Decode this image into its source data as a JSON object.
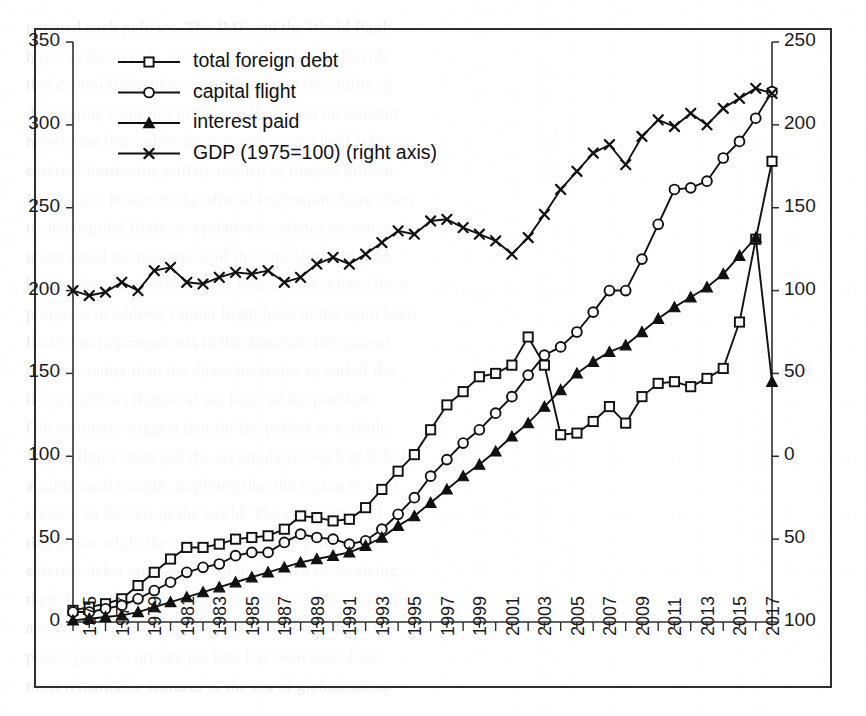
{
  "figure": {
    "background_text_lines": [
      "pursued such policies. The IMF and the World Bank",
      "have, to their credit, recently acknowledged the role",
      "that capital flight plays in undermining the ability of",
      "developing countries to finance their own investment",
      "needs, and that unless these resources are held at home,",
      "external borrowing will be needed to finance growth.",
      "In practice, however, the official institutions have often",
      "treated capital flight as a relatively minor concern, and",
      "understated the magnitude of the capital that may be",
      "hidden abroad. Moreover, the measures that have been",
      "proposed to address capital flight have in the main been",
      "limited to improvements in the domestic investment",
      "climate, rather than the direct measures to curtail the",
      "illicit outflows that lie at the heart of the problem.",
      "Our estimates suggest that for the period as a whole,",
      "capital flight exceeded the accumulated stock of debt by",
      "a substantial margin, implying that the region is a net",
      "creditor to the rest of the world. The counterpart of",
      "this is that while the external assets are private, the",
      "external debts are public, and the burden of servicing",
      "them falls on the population at large through taxation",
      "and cuts in public expenditure. The transfer from the",
      "public purse to private pockets has been one of the",
      "most remarkable features of the era of globalisation."
    ],
    "axis_color": "#2f2f2f",
    "series_color": "#111111"
  },
  "chart_data": {
    "type": "line",
    "title": "",
    "xlabel": "",
    "ylabel": "",
    "y2label": "",
    "grid": false,
    "legend_position": "top-left",
    "ylim": [
      0,
      350
    ],
    "yticks": [
      0,
      50,
      100,
      150,
      200,
      250,
      300,
      350
    ],
    "ytick_labels": [
      "0",
      "50",
      "100",
      "150",
      "200",
      "250",
      "300",
      "350"
    ],
    "y2lim": [
      -100,
      250
    ],
    "y2ticks": [
      -100,
      -50,
      0,
      50,
      100,
      150,
      200,
      250
    ],
    "y2tick_labels": [
      "100",
      "50",
      "0",
      "50",
      "100",
      "150",
      "200",
      "250"
    ],
    "xlim": [
      1975,
      2018
    ],
    "xticks": [
      1975,
      1977,
      1979,
      1981,
      1983,
      1985,
      1987,
      1989,
      1991,
      1993,
      1995,
      1997,
      1999,
      2001,
      2003,
      2005,
      2007,
      2009,
      2011,
      2013,
      2015,
      2017
    ],
    "xtick_labels": [
      "1975",
      "1977",
      "1979",
      "1981",
      "1983",
      "1985",
      "1987",
      "1989",
      "1991",
      "1993",
      "1995",
      "1997",
      "1999",
      "2001",
      "2003",
      "2005",
      "2007",
      "2009",
      "2011",
      "2013",
      "2015",
      "2017"
    ],
    "x": [
      1975,
      1976,
      1977,
      1978,
      1979,
      1980,
      1981,
      1982,
      1983,
      1984,
      1985,
      1986,
      1987,
      1988,
      1989,
      1990,
      1991,
      1992,
      1993,
      1994,
      1995,
      1996,
      1997,
      1998,
      1999,
      2000,
      2001,
      2002,
      2003,
      2004,
      2005,
      2006,
      2007,
      2008,
      2009,
      2010,
      2011,
      2012,
      2013,
      2014,
      2015,
      2016,
      2017,
      2018
    ],
    "series": [
      {
        "name": "total foreign debt",
        "marker": "open-square",
        "axis": "left",
        "values": [
          7,
          9,
          11,
          14,
          22,
          30,
          38,
          45,
          45,
          47,
          50,
          51,
          52,
          56,
          64,
          63,
          61,
          62,
          69,
          80,
          91,
          101,
          116,
          131,
          139,
          148,
          150,
          155,
          172,
          155,
          113,
          114,
          121,
          130,
          120,
          136,
          144,
          145,
          142,
          147,
          153,
          181,
          231,
          278
        ]
      },
      {
        "name": "capital flight",
        "marker": "open-circle",
        "axis": "left",
        "values": [
          6,
          6,
          8,
          10,
          14,
          19,
          24,
          30,
          33,
          35,
          40,
          42,
          42,
          48,
          53,
          51,
          50,
          47,
          49,
          56,
          65,
          75,
          88,
          98,
          108,
          116,
          126,
          136,
          149,
          161,
          166,
          175,
          187,
          200,
          200,
          219,
          240,
          261,
          262,
          266,
          280,
          290,
          304,
          320
        ]
      },
      {
        "name": "interest paid",
        "marker": "filled-triangle",
        "axis": "left",
        "values": [
          1,
          2,
          3,
          4,
          6,
          9,
          12,
          15,
          18,
          21,
          24,
          27,
          30,
          33,
          36,
          38,
          40,
          42,
          46,
          51,
          58,
          64,
          72,
          80,
          88,
          95,
          103,
          112,
          120,
          130,
          140,
          150,
          157,
          163,
          167,
          175,
          183,
          190,
          196,
          202,
          210,
          221,
          232,
          145
        ]
      },
      {
        "name": "GDP (1975=100) (right axis)",
        "marker": "cross",
        "axis": "right",
        "values": [
          100,
          97,
          99,
          105,
          100,
          112,
          114,
          105,
          104,
          108,
          111,
          110,
          112,
          105,
          108,
          116,
          120,
          116,
          122,
          129,
          136,
          134,
          142,
          143,
          138,
          134,
          130,
          122,
          132,
          146,
          161,
          172,
          183,
          188,
          176,
          193,
          203,
          199,
          207,
          200,
          210,
          216,
          222,
          219
        ]
      }
    ]
  },
  "legend": {
    "items": [
      {
        "label": "total foreign debt",
        "marker": "open-square"
      },
      {
        "label": "capital flight",
        "marker": "open-circle"
      },
      {
        "label": "interest paid",
        "marker": "filled-triangle"
      },
      {
        "label": "GDP (1975=100) (right axis)",
        "marker": "cross"
      }
    ]
  }
}
